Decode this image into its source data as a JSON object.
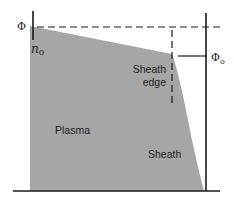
{
  "diagram": {
    "title": "",
    "colors": {
      "background": "#ffffff",
      "region_fill": "#a6a6a6",
      "line": "#1a1a1a"
    },
    "labels": {
      "phi": "Φ",
      "n0_main": "n",
      "n0_sub": "o",
      "phi0_main": "Φ",
      "phi0_sub": "o",
      "sheath_edge_line1": "Sheath",
      "sheath_edge_line2": "edge",
      "plasma": "Plasma",
      "sheath": "Sheath"
    },
    "regions": [
      {
        "name": "Plasma"
      },
      {
        "name": "Sheath"
      }
    ]
  }
}
